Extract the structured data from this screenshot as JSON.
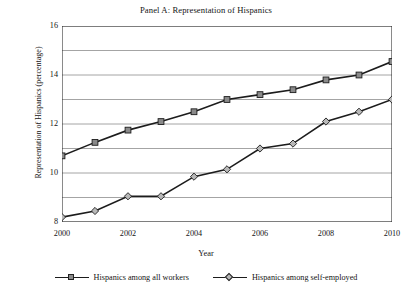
{
  "chart_data": {
    "type": "line",
    "title": "Panel A: Representation of Hispanics",
    "xlabel": "Year",
    "ylabel": "Representation of Hispanics (percentage)",
    "x": [
      2000,
      2001,
      2002,
      2003,
      2004,
      2005,
      2006,
      2007,
      2008,
      2009,
      2010
    ],
    "xtick_labels": [
      "2000",
      "2002",
      "2004",
      "2006",
      "2008",
      "2010"
    ],
    "xticks": [
      2000,
      2002,
      2004,
      2006,
      2008,
      2010
    ],
    "xlim": [
      2000,
      2010
    ],
    "ytick_labels": [
      "8",
      "10",
      "12",
      "14",
      "16"
    ],
    "yticks": [
      8,
      10,
      12,
      14,
      16
    ],
    "ygridlines": [
      8,
      9,
      10,
      11,
      12,
      13,
      14,
      15,
      16
    ],
    "ylim": [
      8,
      16
    ],
    "grid": "horizontal",
    "legend_position": "below",
    "series": [
      {
        "name": "Hispanics among all workers",
        "marker": "square",
        "marker_color": "#8a8a8a",
        "line_color": "#1c1c1c",
        "values": [
          10.7,
          11.25,
          11.75,
          12.1,
          12.5,
          13.0,
          13.2,
          13.4,
          13.8,
          14.0,
          14.55
        ]
      },
      {
        "name": "Hispanics among self-employed",
        "marker": "diamond",
        "marker_color": "#b8b8b8",
        "line_color": "#1c1c1c",
        "values": [
          8.2,
          8.45,
          9.05,
          9.05,
          9.85,
          10.15,
          11.0,
          11.2,
          12.1,
          12.5,
          13.0
        ]
      }
    ]
  },
  "legend": {
    "entries": [
      {
        "label": "Hispanics among all workers"
      },
      {
        "label": "Hispanics among self-employed"
      }
    ]
  }
}
